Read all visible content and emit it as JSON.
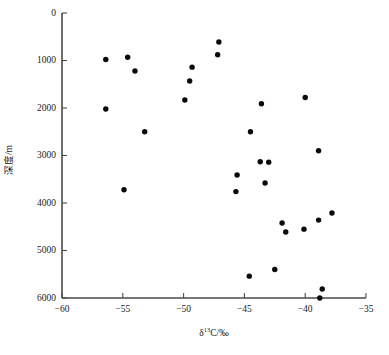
{
  "figure": {
    "caption": ""
  },
  "chart_data": {
    "type": "scatter",
    "title": "",
    "xlabel": "δ¹³C/‰",
    "xlabel_parts": {
      "symbol": "δ",
      "superscript": "13",
      "rest": "C/‰"
    },
    "ylabel": "深度/m",
    "xlim": [
      -60,
      -35
    ],
    "ylim": [
      0,
      6000
    ],
    "y_inverted": true,
    "grid": false,
    "legend": null,
    "xticks": [
      -60,
      -55,
      -50,
      -45,
      -40,
      -35
    ],
    "xtick_labels": [
      "−60",
      "−55",
      "−50",
      "−45",
      "−40",
      "−35"
    ],
    "yticks": [
      0,
      1000,
      2000,
      3000,
      4000,
      5000,
      6000
    ],
    "ytick_labels": [
      "0",
      "1000",
      "2000",
      "3000",
      "4000",
      "5000",
      "6000"
    ],
    "marker": {
      "shape": "circle",
      "color": "#0a0a0a",
      "size": 4.2
    },
    "points": [
      {
        "x": -56.4,
        "y": 980
      },
      {
        "x": -56.4,
        "y": 2020
      },
      {
        "x": -54.6,
        "y": 930
      },
      {
        "x": -54.0,
        "y": 1220
      },
      {
        "x": -54.9,
        "y": 3720
      },
      {
        "x": -53.2,
        "y": 2500
      },
      {
        "x": -49.9,
        "y": 1830
      },
      {
        "x": -49.5,
        "y": 1430
      },
      {
        "x": -49.3,
        "y": 1140
      },
      {
        "x": -47.2,
        "y": 880
      },
      {
        "x": -47.1,
        "y": 610
      },
      {
        "x": -45.6,
        "y": 3410
      },
      {
        "x": -45.7,
        "y": 3760
      },
      {
        "x": -44.5,
        "y": 2500
      },
      {
        "x": -44.6,
        "y": 5540
      },
      {
        "x": -43.6,
        "y": 1910
      },
      {
        "x": -43.7,
        "y": 3130
      },
      {
        "x": -43.0,
        "y": 3140
      },
      {
        "x": -43.3,
        "y": 3580
      },
      {
        "x": -42.5,
        "y": 5400
      },
      {
        "x": -41.9,
        "y": 4420
      },
      {
        "x": -41.6,
        "y": 4610
      },
      {
        "x": -40.0,
        "y": 1780
      },
      {
        "x": -40.1,
        "y": 4550
      },
      {
        "x": -38.9,
        "y": 2900
      },
      {
        "x": -38.9,
        "y": 4360
      },
      {
        "x": -38.6,
        "y": 5810
      },
      {
        "x": -38.8,
        "y": 6000
      },
      {
        "x": -37.8,
        "y": 4210
      }
    ]
  }
}
